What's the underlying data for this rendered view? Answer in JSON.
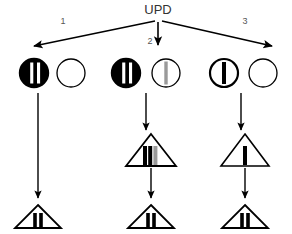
{
  "diagram": {
    "title": "UPD",
    "root_label": "UPD",
    "background_color": "#ffffff",
    "stroke_color": "#000000",
    "fill_dark": "#000000",
    "fill_light": "#ffffff",
    "fill_gray": "#9a9a9a",
    "branch_numbers": [
      "1",
      "2",
      "3"
    ],
    "branches": [
      {
        "number": "1",
        "chromosome_pair": [
          {
            "shape": "circle",
            "fill": "dark",
            "bars": 2,
            "bar_color": "light",
            "outline": "thick",
            "name": "circle-filled-two-bars"
          },
          {
            "shape": "circle",
            "fill": "light",
            "bars": 0,
            "bar_color": "none",
            "outline": "thin",
            "name": "circle-empty"
          }
        ],
        "intermediate": null,
        "result": {
          "shape": "triangle",
          "bars": 2,
          "bar_color": "dark",
          "name": "triangle-two-dark-bars"
        }
      },
      {
        "number": "2",
        "chromosome_pair": [
          {
            "shape": "circle",
            "fill": "dark",
            "bars": 2,
            "bar_color": "light",
            "outline": "thick",
            "name": "circle-filled-two-bars"
          },
          {
            "shape": "circle",
            "fill": "light",
            "bars": 1,
            "bar_color": "gray",
            "outline": "thin",
            "name": "circle-light-one-gray-bar"
          }
        ],
        "intermediate": {
          "shape": "triangle",
          "bars": 3,
          "bar_color": "dark-dark-gray",
          "name": "triangle-three-bars"
        },
        "result": {
          "shape": "triangle",
          "bars": 2,
          "bar_color": "dark",
          "name": "triangle-two-dark-bars"
        }
      },
      {
        "number": "3",
        "chromosome_pair": [
          {
            "shape": "circle",
            "fill": "light",
            "bars": 1,
            "bar_color": "dark",
            "outline": "thick",
            "name": "circle-light-one-dark-bar"
          },
          {
            "shape": "circle",
            "fill": "light",
            "bars": 0,
            "bar_color": "none",
            "outline": "thin",
            "name": "circle-empty"
          }
        ],
        "intermediate": {
          "shape": "triangle",
          "bars": 1,
          "bar_color": "dark",
          "name": "triangle-one-dark-bar"
        },
        "result": {
          "shape": "triangle",
          "bars": 2,
          "bar_color": "dark",
          "name": "triangle-two-dark-bars"
        }
      }
    ]
  }
}
